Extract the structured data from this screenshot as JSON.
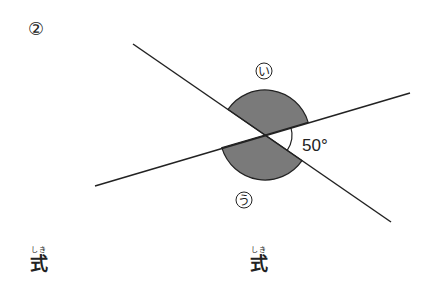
{
  "problem": {
    "number_label": "②"
  },
  "diagram": {
    "angle_labels": {
      "upper": "い",
      "lower": "う",
      "given": "50°"
    },
    "given_angle_degrees": 50,
    "shade_color": "#7a7a7a",
    "line_color": "#222222"
  },
  "answers": [
    {
      "ruby": "しき",
      "label": "式"
    },
    {
      "ruby": "しき",
      "label": "式"
    }
  ]
}
